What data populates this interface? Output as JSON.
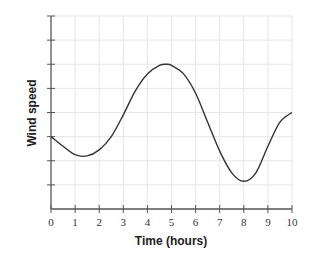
{
  "chart_data": {
    "type": "line",
    "title": "",
    "xlabel": "Time (hours)",
    "ylabel": "Wind speed",
    "xlim": [
      0,
      10
    ],
    "ylim": [
      0,
      8
    ],
    "x_ticks": [
      "0",
      "1",
      "2",
      "3",
      "4",
      "5",
      "6",
      "7",
      "8",
      "9",
      "10"
    ],
    "y_ticks_labeled": false,
    "y_tick_count": 8,
    "grid": true,
    "legend": null,
    "series": [
      {
        "name": "Wind speed",
        "x": [
          0,
          0.5,
          1.0,
          1.5,
          2.0,
          2.5,
          3.0,
          3.5,
          4.0,
          4.5,
          4.8,
          5.0,
          5.5,
          6.0,
          6.5,
          7.0,
          7.5,
          8.0,
          8.5,
          9.0,
          9.5,
          10.0
        ],
        "values": [
          3.0,
          2.6,
          2.25,
          2.2,
          2.45,
          3.0,
          3.9,
          4.9,
          5.6,
          5.95,
          6.0,
          5.95,
          5.6,
          4.8,
          3.6,
          2.4,
          1.5,
          1.15,
          1.5,
          2.6,
          3.6,
          4.0
        ]
      }
    ],
    "colors": {
      "line": "#333333",
      "grid": "#e6e6e6",
      "axis": "#555555"
    }
  }
}
